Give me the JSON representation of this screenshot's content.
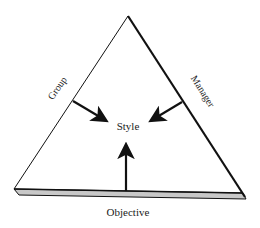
{
  "diagram": {
    "center_label": "Style",
    "left_side_label": "Group",
    "right_side_label": "Manager",
    "base_label": "Objective",
    "colors": {
      "stroke": "#111111",
      "base_fill": "#c8c8c8",
      "text": "#222222",
      "background": "#ffffff"
    },
    "arrows": [
      {
        "from": "Group",
        "to": "Style"
      },
      {
        "from": "Manager",
        "to": "Style"
      },
      {
        "from": "Objective",
        "to": "Style"
      }
    ]
  }
}
